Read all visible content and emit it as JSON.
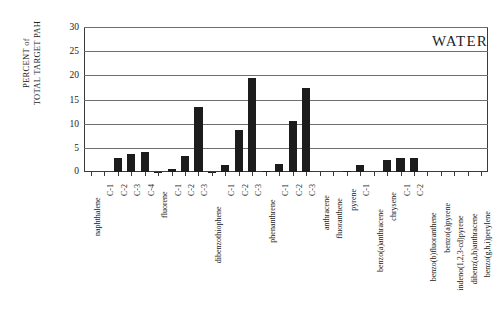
{
  "chart_data": {
    "type": "bar",
    "title": "",
    "annotation": "WATER",
    "xlabel": "",
    "ylabel": "PERCENT of\nTOTAL TARGET PAH",
    "ylim": [
      0,
      30
    ],
    "ytick_labels": [
      "30",
      "25",
      "20",
      "15",
      "10",
      "5",
      "0"
    ],
    "ytick_values": [
      30,
      25,
      20,
      15,
      10,
      5,
      0
    ],
    "grid": true,
    "legend": "none",
    "categories": [
      "naphthalene",
      "C-1",
      "C-2",
      "C-3",
      "C-4",
      "fluorene",
      "C-1",
      "C-2",
      "C-3",
      "dibenzothiophene",
      "C-1",
      "C-2",
      "C-3",
      "phenanthrene",
      "C-1",
      "C-2",
      "C-3",
      "anthracene",
      "fluoranthene",
      "pyrene",
      "C-1",
      "benzo(a)anthracene",
      "chrysene",
      "C-1",
      "C-2",
      "benzo(b)fluoranthene",
      "benzo(a)pyrene",
      "indeno(1,2,3-cd)pyrene",
      "dibenz(a,h)anthracene",
      "benzo(g,h,i)perylene"
    ],
    "values": [
      0.0,
      0.0,
      2.9,
      3.7,
      4.2,
      0.1,
      0.7,
      3.4,
      13.5,
      0.1,
      1.5,
      8.6,
      19.4,
      0.2,
      1.6,
      10.6,
      17.4,
      0.0,
      0.0,
      0.3,
      1.5,
      0.0,
      2.4,
      3.0,
      3.0,
      0.0,
      0.0,
      0.0,
      0.0,
      0.0
    ],
    "colors": {
      "bar": "#1c1c1c",
      "grid": "#6f6f6f",
      "axis": "#3a3a3a",
      "text": "#1a1a1a",
      "background": "#ffffff"
    }
  }
}
